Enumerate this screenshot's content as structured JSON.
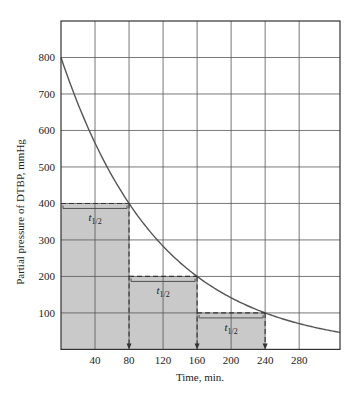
{
  "chart_data": {
    "type": "line",
    "title": "",
    "xlabel": "Time, min.",
    "ylabel": "Partial pressure of DTBP, mmHg",
    "xlim": [
      0,
      328
    ],
    "ylim": [
      0,
      900
    ],
    "xticks": [
      40,
      80,
      120,
      160,
      200,
      240,
      280
    ],
    "yticks": [
      100,
      200,
      300,
      400,
      500,
      600,
      700,
      800
    ],
    "grid": true,
    "series": [
      {
        "name": "DTBP decay",
        "function": "800 * 2^(-t/80)",
        "x": [
          0,
          40,
          80,
          120,
          160,
          200,
          240,
          280,
          320
        ],
        "y": [
          800,
          566,
          400,
          283,
          200,
          141,
          100,
          71,
          50
        ]
      }
    ],
    "half_life_steps": [
      {
        "t_start": 0,
        "t_end": 80,
        "pressure": 400,
        "label": "t",
        "label_sub": "1/2"
      },
      {
        "t_start": 80,
        "t_end": 160,
        "pressure": 200,
        "label": "t",
        "label_sub": "1/2"
      },
      {
        "t_start": 160,
        "t_end": 240,
        "pressure": 100,
        "label": "t",
        "label_sub": "1/2"
      }
    ],
    "colors": {
      "curve": "#555555",
      "grid": "#555555",
      "shade": "#c9c9c9",
      "dash": "#333333",
      "frame": "#333333"
    }
  }
}
